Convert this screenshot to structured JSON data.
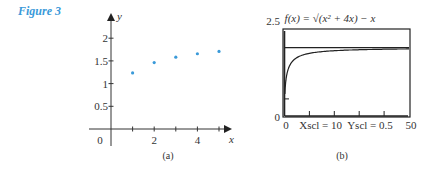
{
  "figure_label": "Figure 3",
  "colors": {
    "accent": "#3a9ad9",
    "points": "#3a9ad9",
    "ink": "#222222"
  },
  "chart_data": [
    {
      "type": "scatter",
      "panel": "(a)",
      "title": "",
      "xlabel": "x",
      "ylabel": "y",
      "x_ticks": [
        1,
        2,
        3,
        4,
        5
      ],
      "x_tick_labels": [
        "2",
        "4"
      ],
      "x_tick_label_positions": [
        2,
        4
      ],
      "y_ticks": [
        0.5,
        1,
        1.5,
        2
      ],
      "y_tick_labels": [
        "0.5",
        "1",
        "1.5",
        "2"
      ],
      "origin_label": "0",
      "x": [
        1,
        2,
        3,
        4,
        5
      ],
      "y": [
        1.236,
        1.464,
        1.583,
        1.657,
        1.708
      ],
      "xlim": [
        0,
        5.5
      ],
      "ylim": [
        0,
        2.5
      ],
      "grid": false,
      "legend": null
    },
    {
      "type": "line",
      "panel": "(b)",
      "title": "f(x) = √(x² + 4x) − x",
      "xlabel": "",
      "ylabel": "",
      "xlim": [
        0,
        50
      ],
      "ylim": [
        0,
        2.5
      ],
      "x_min_label": "0",
      "x_max_label": "50",
      "y_min_label": "0",
      "y_max_label": "2.5",
      "window_note": "Xscl = 10  Yscl = 0.5",
      "asymptote_y": 2,
      "series": [
        {
          "name": "f(x)",
          "function": "sqrt(x^2+4x)-x",
          "x": [
            0.2,
            0.5,
            1,
            2,
            3,
            5,
            8,
            10,
            15,
            20,
            30,
            40,
            50
          ],
          "values": [
            0.69,
            1.0,
            1.24,
            1.46,
            1.58,
            1.71,
            1.8,
            1.83,
            1.88,
            1.91,
            1.94,
            1.95,
            1.96
          ]
        },
        {
          "name": "y = 2",
          "x": [
            0,
            50
          ],
          "values": [
            2,
            2
          ]
        }
      ],
      "grid": false,
      "legend": null
    }
  ]
}
